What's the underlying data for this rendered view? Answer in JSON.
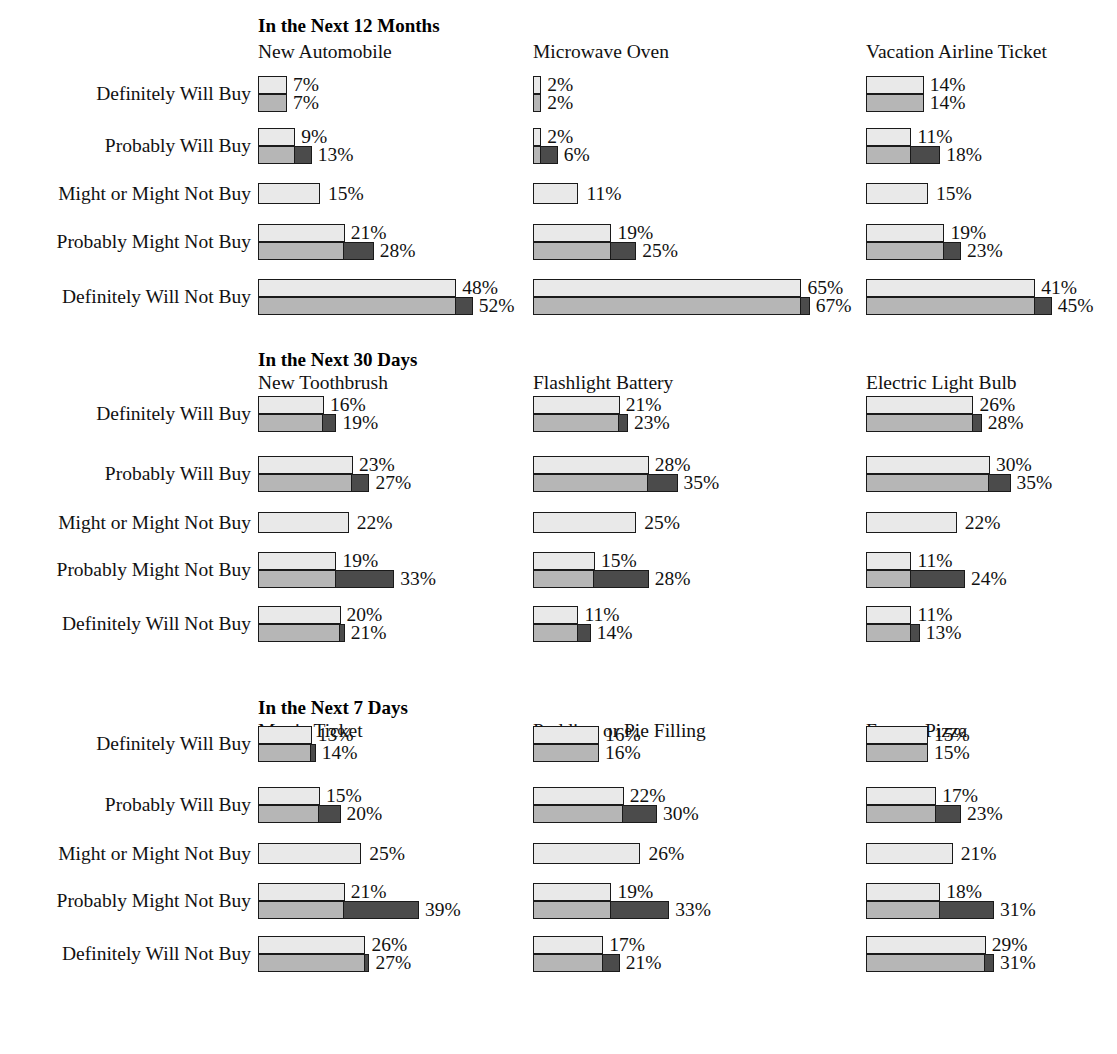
{
  "figure": {
    "row_labels": [
      "Definitely Will Buy",
      "Probably Will Buy",
      "Might or Might Not Buy",
      "Probably Might Not Buy",
      "Definitely Will Not Buy"
    ],
    "colors": {
      "light": "#e9e9e9",
      "mid": "#b6b6b6",
      "dark": "#4b4b4b",
      "outline": "#1a1a1a",
      "background": "#ffffff",
      "text": "#111111"
    },
    "px_per_percent": 4.13,
    "bar_height_px": 18,
    "single_bar_height_px": 21
  },
  "chart_data": {
    "type": "bar",
    "title": "",
    "xlabel": "",
    "ylabel": "",
    "orientation": "horizontal",
    "grid": false,
    "legend": [],
    "categories": [
      "Definitely Will Buy",
      "Probably Will Buy",
      "Might or Might Not Buy",
      "Probably Might Not Buy",
      "Definitely Will Not Buy"
    ],
    "panels": [
      {
        "section": "In the Next 12 Months",
        "charts": [
          {
            "product": "New Automobile",
            "series": [
              {
                "name": "top",
                "values": [
                  7,
                  9,
                  15,
                  21,
                  48
                ]
              },
              {
                "name": "bottom",
                "values": [
                  7,
                  13,
                  null,
                  28,
                  52
                ]
              }
            ],
            "top_labels": [
              "7%",
              "9%",
              "15%",
              "21%",
              "48%"
            ],
            "bottom_labels": [
              "7%",
              "13%",
              null,
              "28%",
              "52%"
            ]
          },
          {
            "product": "Microwave Oven",
            "series": [
              {
                "name": "top",
                "values": [
                  2,
                  2,
                  11,
                  19,
                  65
                ]
              },
              {
                "name": "bottom",
                "values": [
                  2,
                  6,
                  null,
                  25,
                  67
                ]
              }
            ],
            "top_labels": [
              "2%",
              "2%",
              "11%",
              "19%",
              "65%"
            ],
            "bottom_labels": [
              "2%",
              "6%",
              null,
              "25%",
              "67%"
            ]
          },
          {
            "product": "Vacation Airline Ticket",
            "series": [
              {
                "name": "top",
                "values": [
                  14,
                  11,
                  15,
                  19,
                  41
                ]
              },
              {
                "name": "bottom",
                "values": [
                  14,
                  18,
                  null,
                  23,
                  45
                ]
              }
            ],
            "top_labels": [
              "14%",
              "11%",
              "15%",
              "19%",
              "41%"
            ],
            "bottom_labels": [
              "14%",
              "18%",
              null,
              "23%",
              "45%"
            ]
          }
        ]
      },
      {
        "section": "In the Next 30 Days",
        "charts": [
          {
            "product": "New Toothbrush",
            "series": [
              {
                "name": "top",
                "values": [
                  16,
                  23,
                  22,
                  19,
                  20
                ]
              },
              {
                "name": "bottom",
                "values": [
                  19,
                  27,
                  null,
                  33,
                  21
                ]
              }
            ],
            "top_labels": [
              "16%",
              "23%",
              "22%",
              "19%",
              "20%"
            ],
            "bottom_labels": [
              "19%",
              "27%",
              null,
              "33%",
              "21%"
            ]
          },
          {
            "product": "Flashlight Battery",
            "series": [
              {
                "name": "top",
                "values": [
                  21,
                  28,
                  25,
                  15,
                  11
                ]
              },
              {
                "name": "bottom",
                "values": [
                  23,
                  35,
                  null,
                  28,
                  14
                ]
              }
            ],
            "top_labels": [
              "21%",
              "28%",
              "25%",
              "15%",
              "11%"
            ],
            "bottom_labels": [
              "23%",
              "35%",
              null,
              "28%",
              "14%"
            ]
          },
          {
            "product": "Electric Light Bulb",
            "series": [
              {
                "name": "top",
                "values": [
                  26,
                  30,
                  22,
                  11,
                  11
                ]
              },
              {
                "name": "bottom",
                "values": [
                  28,
                  35,
                  null,
                  24,
                  13
                ]
              }
            ],
            "top_labels": [
              "26%",
              "30%",
              "22%",
              "11%",
              "11%"
            ],
            "bottom_labels": [
              "28%",
              "35%",
              null,
              "24%",
              "13%"
            ]
          }
        ]
      },
      {
        "section": "In the Next 7 Days",
        "charts": [
          {
            "product": "Movie Ticket",
            "series": [
              {
                "name": "top",
                "values": [
                  13,
                  15,
                  25,
                  21,
                  26
                ]
              },
              {
                "name": "bottom",
                "values": [
                  14,
                  20,
                  null,
                  39,
                  27
                ]
              }
            ],
            "top_labels": [
              "13%",
              "15%",
              "25%",
              "21%",
              "26%"
            ],
            "bottom_labels": [
              "14%",
              "20%",
              null,
              "39%",
              "27%"
            ]
          },
          {
            "product": "Pudding or Pie Filling",
            "series": [
              {
                "name": "top",
                "values": [
                  16,
                  22,
                  26,
                  19,
                  17
                ]
              },
              {
                "name": "bottom",
                "values": [
                  16,
                  30,
                  null,
                  33,
                  21
                ]
              }
            ],
            "top_labels": [
              "16%",
              "22%",
              "26%",
              "19%",
              "17%"
            ],
            "bottom_labels": [
              "16%",
              "30%",
              null,
              "33%",
              "21%"
            ]
          },
          {
            "product": "Frozen Pizza",
            "series": [
              {
                "name": "top",
                "values": [
                  15,
                  17,
                  21,
                  18,
                  29
                ]
              },
              {
                "name": "bottom",
                "values": [
                  15,
                  23,
                  null,
                  31,
                  31
                ]
              }
            ],
            "top_labels": [
              "15%",
              "17%",
              "21%",
              "18%",
              "29%"
            ],
            "bottom_labels": [
              "15%",
              "23%",
              null,
              "31%",
              "31%"
            ]
          }
        ]
      }
    ]
  }
}
